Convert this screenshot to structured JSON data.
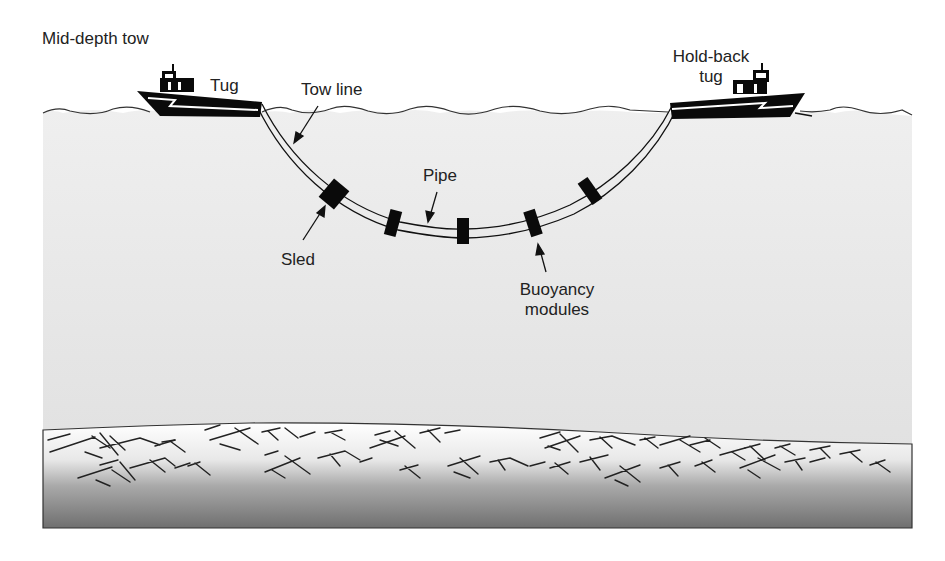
{
  "title": "Mid-depth tow",
  "labels": {
    "tug": "Tug",
    "tow_line": "Tow line",
    "holdback_tug_line1": "Hold-back",
    "holdback_tug_line2": "tug",
    "pipe": "Pipe",
    "sled": "Sled",
    "buoyancy_line1": "Buoyancy",
    "buoyancy_line2": "modules"
  },
  "colors": {
    "water_top": "#eeeeee",
    "water_bottom": "#e2e2e2",
    "seabed_top": "#ffffff",
    "seabed_bottom": "#6e6e6e",
    "ink": "#111111"
  }
}
